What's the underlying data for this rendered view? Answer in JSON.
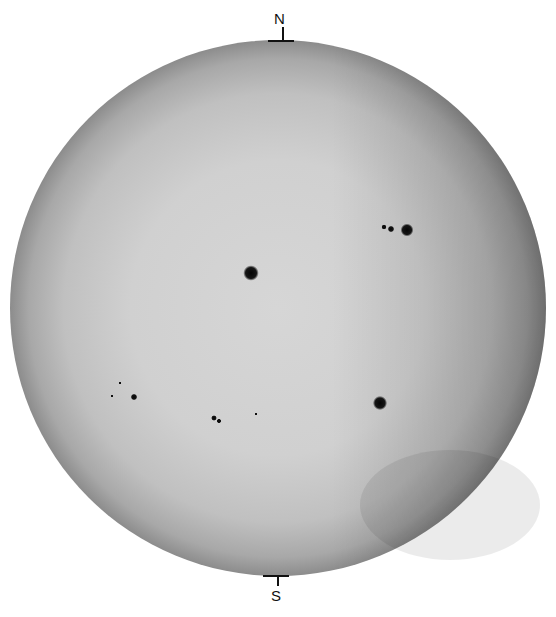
{
  "image": {
    "subject": "Solar disk photograph with sunspots",
    "background_color": "#ffffff",
    "disk": {
      "cx": 278,
      "cy": 308,
      "r": 268,
      "center_color": "#d4d4d4",
      "limb_color": "#8a8a8a"
    }
  },
  "orientation": {
    "north_label": "N",
    "south_label": "S"
  },
  "sunspots": [
    {
      "name": "central-spot",
      "cx": 251,
      "cy": 273,
      "r": 6
    },
    {
      "name": "northwest-spot",
      "cx": 407,
      "cy": 230,
      "r": 5
    },
    {
      "name": "northwest-small-1",
      "cx": 391,
      "cy": 229,
      "r": 2.5
    },
    {
      "name": "northwest-small-2",
      "cx": 384,
      "cy": 227,
      "r": 2
    },
    {
      "name": "southwest-spot",
      "cx": 380,
      "cy": 403,
      "r": 5.5
    },
    {
      "name": "southeast-spot",
      "cx": 134,
      "cy": 397,
      "r": 2.5
    },
    {
      "name": "southeast-faint-1",
      "cx": 120,
      "cy": 383,
      "r": 1.2
    },
    {
      "name": "southeast-faint-2",
      "cx": 112,
      "cy": 396,
      "r": 1.2
    },
    {
      "name": "south-group-1",
      "cx": 214,
      "cy": 418,
      "r": 2.2
    },
    {
      "name": "south-group-2",
      "cx": 219,
      "cy": 421,
      "r": 1.8
    },
    {
      "name": "south-small",
      "cx": 256,
      "cy": 414,
      "r": 1.2
    }
  ]
}
